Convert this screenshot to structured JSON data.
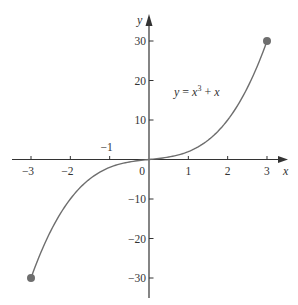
{
  "chart_data": {
    "type": "line",
    "title": "",
    "function_label": "y = x³ + x",
    "function_label_parts": {
      "lhs": "y = ",
      "base": "x",
      "exp": "3",
      "rhs": " + x"
    },
    "xlabel": "x",
    "ylabel": "y",
    "xlim": [
      -3.4,
      3.5
    ],
    "ylim": [
      -35,
      36
    ],
    "x_ticks": [
      -3,
      -2,
      -1,
      1,
      2,
      3
    ],
    "x_tick_labels": [
      "−3",
      "−2",
      "−1",
      "1",
      "2",
      "3"
    ],
    "y_ticks": [
      -30,
      -20,
      -10,
      10,
      20,
      30
    ],
    "y_tick_labels": [
      "−30",
      "−20",
      "−10",
      "10",
      "20",
      "30"
    ],
    "origin_label": "0",
    "grid": false,
    "legend": null,
    "series": [
      {
        "name": "y = x^3 + x",
        "x": [
          -3,
          -2.5,
          -2,
          -1.5,
          -1,
          -0.5,
          0,
          0.5,
          1,
          1.5,
          2,
          2.5,
          3
        ],
        "y": [
          -30,
          -18.125,
          -10,
          -4.875,
          -2,
          -0.625,
          0,
          0.625,
          2,
          4.875,
          10,
          18.125,
          30
        ]
      }
    ],
    "endpoints": [
      {
        "x": -3,
        "y": -30,
        "marker": "filled-circle"
      },
      {
        "x": 3,
        "y": 30,
        "marker": "filled-circle"
      }
    ]
  },
  "colors": {
    "axis": "#333333",
    "curve": "#6e6e6e",
    "endpoint": "#6e6e6e",
    "text": "#333333",
    "background": "#ffffff"
  }
}
